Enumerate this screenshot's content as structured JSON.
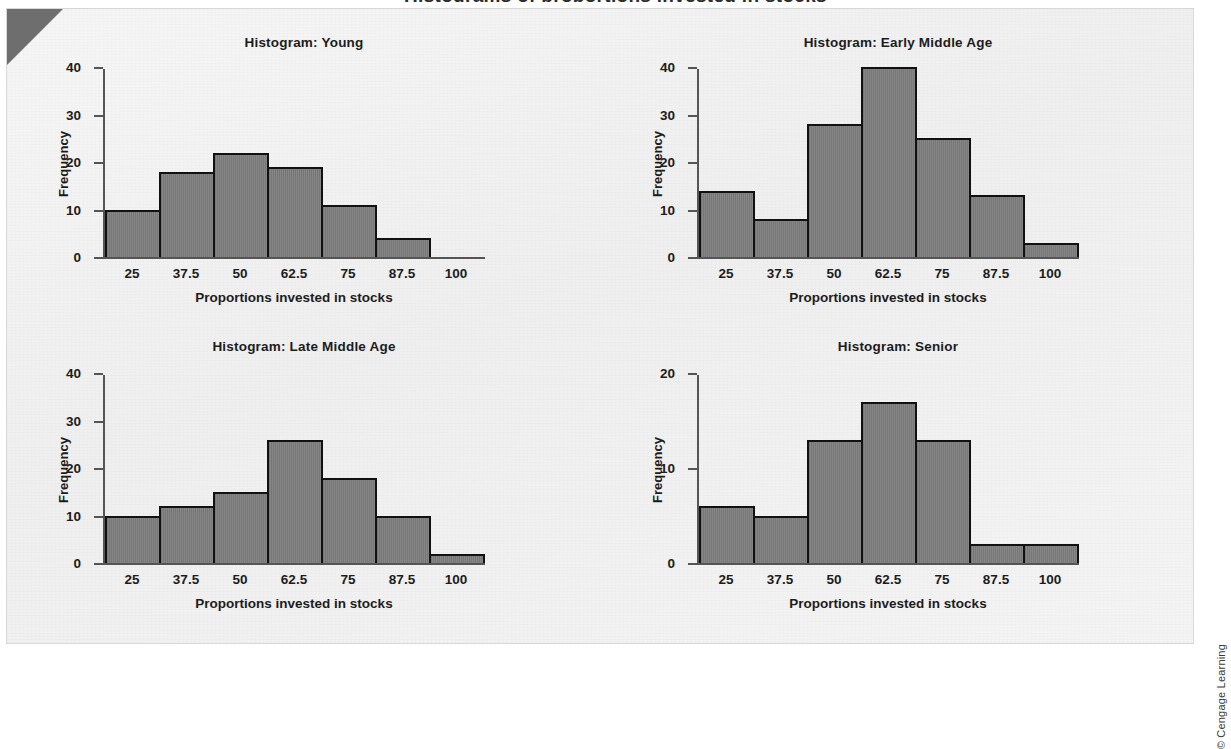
{
  "figure": {
    "cut_heading": "Histograms of proportions invested in stocks",
    "copyright": "© Cengage Learning"
  },
  "chart_data": [
    {
      "type": "bar",
      "title": "Histogram: Young",
      "xlabel": "Proportions invested in stocks",
      "ylabel": "Frequency",
      "categories": [
        "25",
        "37.5",
        "50",
        "62.5",
        "75",
        "87.5",
        "100"
      ],
      "values": [
        10,
        18,
        22,
        19,
        11,
        4,
        0
      ],
      "yticks": [
        "0",
        "10",
        "20",
        "30",
        "40"
      ],
      "ylim": [
        0,
        40
      ],
      "grid": false,
      "legend": "none"
    },
    {
      "type": "bar",
      "title": "Histogram: Early Middle Age",
      "xlabel": "Proportions invested in stocks",
      "ylabel": "Frequency",
      "categories": [
        "25",
        "37.5",
        "50",
        "62.5",
        "75",
        "87.5",
        "100"
      ],
      "values": [
        14,
        8,
        28,
        40,
        25,
        13,
        3
      ],
      "yticks": [
        "0",
        "10",
        "20",
        "30",
        "40"
      ],
      "ylim": [
        0,
        40
      ],
      "grid": false,
      "legend": "none"
    },
    {
      "type": "bar",
      "title": "Histogram: Late Middle Age",
      "xlabel": "Proportions invested in stocks",
      "ylabel": "Frequency",
      "categories": [
        "25",
        "37.5",
        "50",
        "62.5",
        "75",
        "87.5",
        "100"
      ],
      "values": [
        10,
        12,
        15,
        26,
        18,
        10,
        2
      ],
      "yticks": [
        "0",
        "10",
        "20",
        "30",
        "40"
      ],
      "ylim": [
        0,
        40
      ],
      "grid": false,
      "legend": "none"
    },
    {
      "type": "bar",
      "title": "Histogram: Senior",
      "xlabel": "Proportions invested in stocks",
      "ylabel": "Frequency",
      "categories": [
        "25",
        "37.5",
        "50",
        "62.5",
        "75",
        "87.5",
        "100"
      ],
      "values": [
        6,
        5,
        13,
        17,
        13,
        2,
        2
      ],
      "yticks": [
        "0",
        "10",
        "20"
      ],
      "ylim": [
        0,
        20
      ],
      "grid": false,
      "legend": "none"
    }
  ],
  "style": {
    "bar_fill": "#808080",
    "bar_stroke": "#111111",
    "axis_color": "#555555",
    "text_color": "#1c1c1c",
    "panel_bg": "#f2f2f2",
    "dogear": "#6e6e6e"
  }
}
